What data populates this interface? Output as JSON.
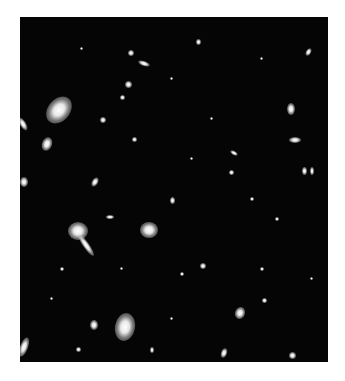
{
  "image": {
    "subject": "deep-field galaxy cluster photograph",
    "background_color": "#050505",
    "frame": {
      "left": 20,
      "top": 17,
      "width": 308,
      "height": 345
    },
    "galaxies": [
      {
        "x": 28,
        "y": 78,
        "w": 22,
        "h": 30,
        "rot": 40
      },
      {
        "x": 22,
        "y": 120,
        "w": 10,
        "h": 14,
        "rot": 20
      },
      {
        "x": 0,
        "y": 100,
        "w": 6,
        "h": 14,
        "rot": -30
      },
      {
        "x": 0,
        "y": 160,
        "w": 8,
        "h": 10,
        "rot": 0
      },
      {
        "x": 48,
        "y": 205,
        "w": 20,
        "h": 18,
        "rot": 0
      },
      {
        "x": 63,
        "y": 215,
        "w": 6,
        "h": 26,
        "rot": -35
      },
      {
        "x": 86,
        "y": 198,
        "w": 8,
        "h": 4,
        "rot": 0
      },
      {
        "x": 120,
        "y": 205,
        "w": 18,
        "h": 16,
        "rot": 0
      },
      {
        "x": 95,
        "y": 296,
        "w": 20,
        "h": 28,
        "rot": 10
      },
      {
        "x": 70,
        "y": 303,
        "w": 8,
        "h": 10,
        "rot": 0
      },
      {
        "x": 0,
        "y": 320,
        "w": 8,
        "h": 20,
        "rot": 20
      },
      {
        "x": 118,
        "y": 44,
        "w": 12,
        "h": 5,
        "rot": 20
      },
      {
        "x": 108,
        "y": 33,
        "w": 6,
        "h": 6,
        "rot": 0
      },
      {
        "x": 105,
        "y": 64,
        "w": 7,
        "h": 7,
        "rot": 0
      },
      {
        "x": 176,
        "y": 22,
        "w": 5,
        "h": 6,
        "rot": 0
      },
      {
        "x": 286,
        "y": 31,
        "w": 5,
        "h": 8,
        "rot": 30
      },
      {
        "x": 267,
        "y": 86,
        "w": 8,
        "h": 12,
        "rot": 0
      },
      {
        "x": 269,
        "y": 120,
        "w": 12,
        "h": 6,
        "rot": 0
      },
      {
        "x": 210,
        "y": 134,
        "w": 8,
        "h": 4,
        "rot": 30
      },
      {
        "x": 209,
        "y": 153,
        "w": 5,
        "h": 5,
        "rot": 0
      },
      {
        "x": 282,
        "y": 150,
        "w": 5,
        "h": 8,
        "rot": 0
      },
      {
        "x": 290,
        "y": 150,
        "w": 4,
        "h": 8,
        "rot": 0
      },
      {
        "x": 215,
        "y": 290,
        "w": 10,
        "h": 12,
        "rot": 20
      },
      {
        "x": 242,
        "y": 281,
        "w": 5,
        "h": 5,
        "rot": 0
      },
      {
        "x": 201,
        "y": 331,
        "w": 6,
        "h": 10,
        "rot": 20
      },
      {
        "x": 269,
        "y": 335,
        "w": 7,
        "h": 7,
        "rot": 0
      },
      {
        "x": 72,
        "y": 160,
        "w": 6,
        "h": 10,
        "rot": 30
      },
      {
        "x": 80,
        "y": 100,
        "w": 6,
        "h": 6,
        "rot": 0
      },
      {
        "x": 100,
        "y": 78,
        "w": 5,
        "h": 5,
        "rot": 0
      },
      {
        "x": 112,
        "y": 120,
        "w": 5,
        "h": 5,
        "rot": 0
      },
      {
        "x": 180,
        "y": 246,
        "w": 6,
        "h": 6,
        "rot": 0
      },
      {
        "x": 240,
        "y": 250,
        "w": 4,
        "h": 4,
        "rot": 0
      },
      {
        "x": 150,
        "y": 180,
        "w": 5,
        "h": 7,
        "rot": 0
      },
      {
        "x": 160,
        "y": 255,
        "w": 4,
        "h": 4,
        "rot": 0
      },
      {
        "x": 40,
        "y": 250,
        "w": 4,
        "h": 4,
        "rot": 0
      },
      {
        "x": 56,
        "y": 330,
        "w": 5,
        "h": 5,
        "rot": 0
      },
      {
        "x": 130,
        "y": 330,
        "w": 4,
        "h": 6,
        "rot": 0
      },
      {
        "x": 255,
        "y": 200,
        "w": 4,
        "h": 4,
        "rot": 0
      },
      {
        "x": 230,
        "y": 180,
        "w": 4,
        "h": 4,
        "rot": 0
      },
      {
        "x": 190,
        "y": 100,
        "w": 3,
        "h": 3,
        "rot": 0
      },
      {
        "x": 150,
        "y": 60,
        "w": 3,
        "h": 3,
        "rot": 0
      },
      {
        "x": 60,
        "y": 30,
        "w": 3,
        "h": 3,
        "rot": 0
      },
      {
        "x": 240,
        "y": 40,
        "w": 3,
        "h": 3,
        "rot": 0
      },
      {
        "x": 170,
        "y": 140,
        "w": 3,
        "h": 3,
        "rot": 0
      },
      {
        "x": 100,
        "y": 250,
        "w": 3,
        "h": 3,
        "rot": 0
      },
      {
        "x": 290,
        "y": 260,
        "w": 3,
        "h": 3,
        "rot": 0
      },
      {
        "x": 30,
        "y": 280,
        "w": 3,
        "h": 3,
        "rot": 0
      },
      {
        "x": 150,
        "y": 300,
        "w": 3,
        "h": 3,
        "rot": 0
      }
    ]
  }
}
